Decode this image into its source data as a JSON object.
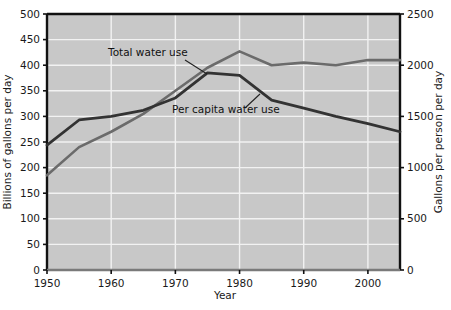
{
  "chart_data": {
    "type": "line",
    "title": "",
    "xlabel": "Year",
    "ylabel_left": "Billions of gallons per day",
    "ylabel_right": "Gallons per person per day",
    "xlim": [
      1950,
      2005
    ],
    "ylim_left": [
      0,
      500
    ],
    "ylim_right": [
      0,
      2500
    ],
    "grid": true,
    "legend": "inline-annotations",
    "plot_background": "#c8c8c8",
    "gridline_color": "#f2f2f2",
    "x_ticks": [
      1950,
      1960,
      1970,
      1980,
      1990,
      2000
    ],
    "x_tick_labels": [
      "1950",
      "1960",
      "1970",
      "1980",
      "1990",
      "2000"
    ],
    "y_ticks_left": [
      0,
      50,
      100,
      150,
      200,
      250,
      300,
      350,
      400,
      450,
      500
    ],
    "y_tick_labels_left": [
      "0",
      "50",
      "100",
      "150",
      "200",
      "250",
      "300",
      "350",
      "400",
      "450",
      "500"
    ],
    "y_ticks_right": [
      0,
      500,
      1000,
      1500,
      2000,
      2500
    ],
    "y_tick_labels_right": [
      "0",
      "500",
      "1000",
      "1500",
      "2000",
      "2500"
    ],
    "series": [
      {
        "name": "Total water use",
        "label": "Total water use",
        "axis": "left",
        "units": "Billions of gallons per day",
        "color": "#6b6b6b",
        "x": [
          1950,
          1955,
          1960,
          1965,
          1970,
          1975,
          1980,
          1985,
          1990,
          1995,
          2000,
          2005
        ],
        "values": [
          185,
          240,
          270,
          305,
          350,
          395,
          427,
          400,
          405,
          400,
          410,
          410
        ]
      },
      {
        "name": "Per capita water use",
        "label": "Per capita water use",
        "axis": "right",
        "units": "Gallons per person per day",
        "color": "#333333",
        "x": [
          1950,
          1955,
          1960,
          1965,
          1970,
          1975,
          1980,
          1985,
          1990,
          1995,
          2000,
          2005
        ],
        "values": [
          1220,
          1465,
          1500,
          1560,
          1680,
          1925,
          1900,
          1660,
          1580,
          1500,
          1430,
          1350
        ]
      }
    ],
    "annotations": [
      {
        "name": "total-water-use-label",
        "text": "Total water use",
        "x_px": 108,
        "y_px": 56,
        "leader_from": [
          185,
          60
        ],
        "leader_to": [
          207,
          74
        ]
      },
      {
        "name": "per-capita-water-use-label",
        "text": "Per capita water use",
        "x_px": 172,
        "y_px": 113,
        "leader_from": [
          245,
          108
        ],
        "leader_to": [
          260,
          94
        ]
      }
    ]
  }
}
